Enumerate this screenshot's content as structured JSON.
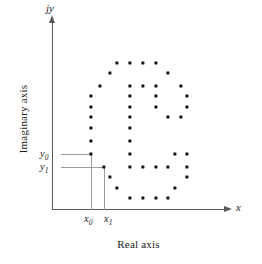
{
  "figure": {
    "title": "",
    "background_color": "#ffffff",
    "dot_color": "#111111",
    "axis_color": "#5a5a5a",
    "guide_color": "#9a9a9a"
  },
  "axes": {
    "y_axis_var_label": "jy",
    "x_axis_var_label": "x",
    "y_axis_title": "Imaginary axis",
    "x_axis_title": "Real axis"
  },
  "tick_labels": {
    "y0": {
      "base": "y",
      "sub": "0"
    },
    "y1": {
      "base": "y",
      "sub": "1"
    },
    "x0": {
      "base": "x",
      "sub": "0"
    },
    "x1": {
      "base": "x",
      "sub": "1"
    }
  },
  "guides": [
    {
      "name": "guide-y0-horizontal",
      "orientation": "h",
      "left": 61,
      "top": 154,
      "length": 30
    },
    {
      "name": "guide-y1-horizontal",
      "orientation": "h",
      "left": 61,
      "top": 167,
      "length": 43
    },
    {
      "name": "guide-x0-vertical",
      "orientation": "v",
      "left": 91,
      "top": 154,
      "length": 56
    },
    {
      "name": "guide-x1-vertical",
      "orientation": "v",
      "left": 104,
      "top": 167,
      "length": 43
    }
  ],
  "chart_data": {
    "type": "scatter",
    "title": "",
    "xlabel": "Real axis",
    "ylabel": "Imaginary axis",
    "x_axis_variable": "x",
    "y_axis_variable": "jy",
    "grid": false,
    "legend": "none",
    "marker": "square",
    "marker_color": "#111111",
    "annotated_points": [
      {
        "label": "(x0, y0)",
        "x_tick": "x0",
        "y_tick": "y0",
        "px": 91,
        "py": 154
      },
      {
        "label": "(x1, y1)",
        "x_tick": "x1",
        "y_tick": "y1",
        "px": 104,
        "py": 167
      }
    ],
    "note": "Pixel coordinates of every plotted sample point forming the digitized boundary pattern.",
    "points": [
      [
        117,
        63
      ],
      [
        130,
        63
      ],
      [
        143,
        63
      ],
      [
        156,
        63
      ],
      [
        110,
        73
      ],
      [
        168,
        73
      ],
      [
        100,
        86
      ],
      [
        130,
        86
      ],
      [
        143,
        86
      ],
      [
        156,
        86
      ],
      [
        181,
        86
      ],
      [
        91,
        96
      ],
      [
        130,
        96
      ],
      [
        156,
        96
      ],
      [
        187,
        96
      ],
      [
        91,
        107
      ],
      [
        130,
        107
      ],
      [
        156,
        107
      ],
      [
        187,
        107
      ],
      [
        91,
        117
      ],
      [
        130,
        117
      ],
      [
        168,
        117
      ],
      [
        181,
        117
      ],
      [
        91,
        128
      ],
      [
        130,
        128
      ],
      [
        91,
        141
      ],
      [
        130,
        141
      ],
      [
        91,
        154
      ],
      [
        130,
        154
      ],
      [
        175,
        154
      ],
      [
        187,
        154
      ],
      [
        104,
        167
      ],
      [
        130,
        167
      ],
      [
        143,
        167
      ],
      [
        156,
        167
      ],
      [
        168,
        167
      ],
      [
        187,
        167
      ],
      [
        110,
        177
      ],
      [
        187,
        177
      ],
      [
        117,
        188
      ],
      [
        175,
        188
      ],
      [
        130,
        198
      ],
      [
        143,
        198
      ],
      [
        156,
        198
      ],
      [
        168,
        198
      ]
    ]
  }
}
